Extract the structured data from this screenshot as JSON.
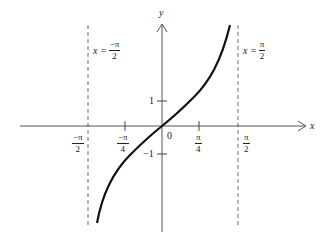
{
  "diagram": {
    "axes": {
      "x_label": "x",
      "y_label": "y"
    },
    "origin_label": "0",
    "y_ticks": [
      {
        "label": "1",
        "value": 1
      },
      {
        "label": "−1",
        "value": -1
      }
    ],
    "x_ticks": [
      {
        "num": "−π",
        "den": "2",
        "value": -1.5708
      },
      {
        "num": "−π",
        "den": "4",
        "value": -0.7854
      },
      {
        "num": "π",
        "den": "4",
        "value": 0.7854
      },
      {
        "num": "π",
        "den": "2",
        "value": 1.5708
      }
    ],
    "asymptotes": [
      {
        "lhs": "x =",
        "num": "−π",
        "den": "2",
        "style": "dashed"
      },
      {
        "lhs": "x =",
        "num": "π",
        "den": "2",
        "style": "dashed"
      }
    ],
    "curve": {
      "function": "tan(x)",
      "stroke": "#111111"
    }
  }
}
